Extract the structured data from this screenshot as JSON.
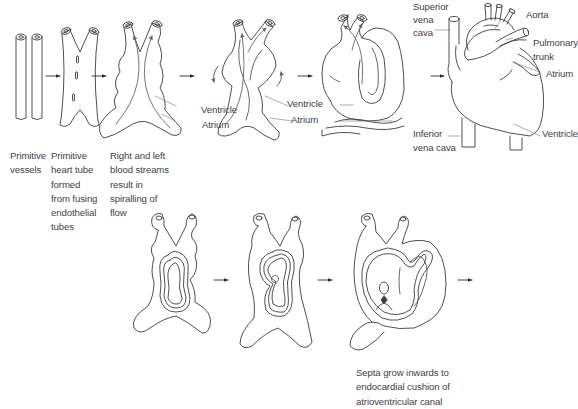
{
  "diagram": {
    "top_row": {
      "stages": [
        {
          "id": "stage-1",
          "caption": "Primitive\nvessels"
        },
        {
          "id": "stage-2",
          "caption": "Primitive\nheart tube\nformed\nfrom fusing\nendothelial\ntubes"
        },
        {
          "id": "stage-3",
          "caption": "Right and left\nblood streams\nresult in\nspiralling of\nflow"
        },
        {
          "id": "stage-4",
          "caption": ""
        },
        {
          "id": "stage-5",
          "caption": ""
        },
        {
          "id": "stage-6",
          "caption": ""
        }
      ],
      "labels": {
        "stage3_ventricle": "Ventricle",
        "stage3_atrium": "Atrium",
        "stage4_ventricle": "Ventricle",
        "stage4_atrium": "Atrium",
        "superior_vena_cava_1": "Superior",
        "superior_vena_cava_2": "vena",
        "superior_vena_cava_3": "cava",
        "aorta": "Aorta",
        "pulmonary_trunk_1": "Pulmonary",
        "pulmonary_trunk_2": "trunk",
        "atrium": "Atrium",
        "inferior_vena_cava_1": "Inferior",
        "inferior_vena_cava_2": "vena cava",
        "ventricle": "Ventricle"
      }
    },
    "bottom_row": {
      "caption": "Septa grow inwards to\nendocardial cushion of\natrioventricular canal"
    },
    "colors": {
      "line": "#3c3c3c",
      "text": "#3f3f3f",
      "background": "#ffffff"
    }
  }
}
